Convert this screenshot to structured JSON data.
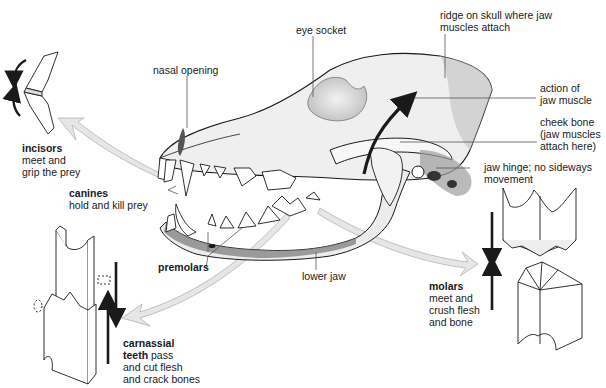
{
  "diagram": {
    "labels": {
      "eye_socket": "eye socket",
      "ridge": [
        "ridge on skull where jaw",
        "muscles attach"
      ],
      "nasal_opening": "nasal opening",
      "action": [
        "action of",
        "jaw muscle"
      ],
      "cheek_bone": [
        "cheek bone",
        "(jaw muscles",
        "attach here)"
      ],
      "jaw_hinge": [
        "jaw hinge; no sideways",
        "movement"
      ],
      "incisors": {
        "title": "incisors",
        "lines": [
          "meet and",
          "grip the prey"
        ]
      },
      "canines": {
        "title": "canines",
        "line": "hold and kill prey"
      },
      "premolars": "premolars",
      "lower_jaw": "lower jaw",
      "molars": {
        "title": "molars",
        "lines": [
          "meet and",
          "crush flesh",
          "and bone"
        ]
      },
      "carnassial": {
        "title": "carnassial",
        "title2": "teeth",
        "line1_rest": " pass",
        "lines": [
          "and cut flesh",
          "and crack bones"
        ]
      }
    },
    "colors": {
      "ink": "#1a1a1a",
      "bone": "#eeeeee",
      "shade": "#9a9a9a",
      "arrow_fill": "#e4e4e4",
      "arrow_stroke": "#b0b0b0",
      "leader": "#555555"
    }
  }
}
